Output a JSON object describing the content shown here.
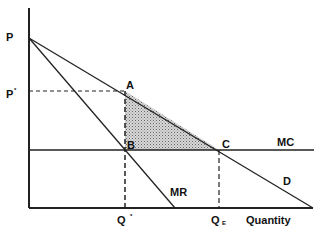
{
  "diagram": {
    "type": "monopoly deadweight loss",
    "axis": {
      "x_label": "Quantity"
    },
    "labels": {
      "P": "P",
      "P_star": "P",
      "P_star_sup": "*",
      "A": "A",
      "B": "B",
      "C": "C",
      "MC": "MC",
      "MR": "MR",
      "D": "D",
      "Q_star": "Q",
      "Q_star_sup": "*",
      "Q_E": "Q",
      "Q_E_sub": "E"
    },
    "colors": {
      "line": "#222222",
      "shade": "#b8b8b8"
    }
  }
}
